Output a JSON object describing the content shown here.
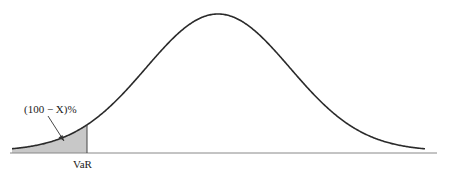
{
  "diagram": {
    "type": "normal-distribution-var",
    "tail_label": "(100 − X)%",
    "var_label": "VaR",
    "colors": {
      "curve": "#2a2a2a",
      "axis": "#888888",
      "tail_fill": "#c8c8c8",
      "text": "#222222"
    },
    "layout": {
      "baseline_y": 153,
      "axis_x_start": 10,
      "axis_x_end": 437,
      "peak_x": 218,
      "peak_y": 14,
      "curve_x_start": 12,
      "curve_x_end": 425,
      "var_x": 87
    }
  }
}
